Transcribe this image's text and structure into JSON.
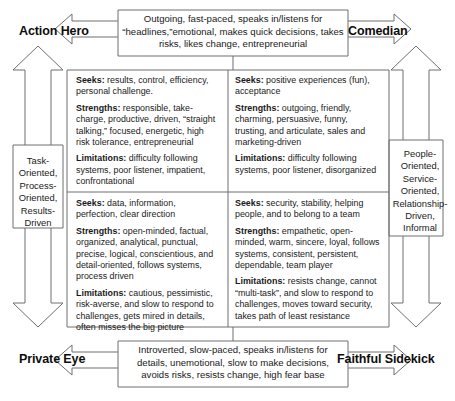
{
  "diagram": {
    "line_color": "#6e6e6e",
    "text_color": "#1a1a1a"
  },
  "corners": {
    "top_left": "Action Hero",
    "top_right": "Comedian",
    "bottom_left": "Private Eye",
    "bottom_right": "Faithful Sidekick"
  },
  "banners": {
    "top": "Outgoing, fast-paced, speaks in/listens for “headlines,”emotional, makes quick decisions, takes risks, likes change, entrepreneurial",
    "bottom": "Introverted, slow-paced, speaks in/listens for details, unemotional, slow to make decisions, avoids risks, resists change, high fear base"
  },
  "sides": {
    "left": "Task-Oriented, Process-Oriented, Results-Driven",
    "right": "People-Oriented, Service-Oriented, Relationship-Driven, Informal"
  },
  "quadrants": {
    "top_left": {
      "seeks_label": "Seeks:",
      "seeks": " results, control, efficiency, personal challenge.",
      "strengths_label": "Strengths:",
      "strengths": " responsible, take-charge, productive, driven, “straight talking,” focused, energetic, high risk tolerance, entrepreneurial",
      "limitations_label": "Limitations:",
      "limitations": " difficulty following systems, poor listener, impatient, confrontational"
    },
    "top_right": {
      "seeks_label": "Seeks:",
      "seeks": " positive experiences (fun), acceptance",
      "strengths_label": "Strengths:",
      "strengths": " outgoing, friendly, charming, persuasive, funny, trusting, and articulate, sales and marketing-driven",
      "limitations_label": "Limitations:",
      "limitations": " difficulty following systems, poor listener, disorganized"
    },
    "bottom_left": {
      "seeks_label": "Seeks:",
      "seeks": " data, information, perfection, clear direction",
      "strengths_label": "Strengths:",
      "strengths": " open-minded, factual, organized, analytical, punctual, precise, logical, conscientious, and detail-oriented, follows systems, process driven",
      "limitations_label": "Limitations:",
      "limitations": " cautious, pessimistic, risk-averse, and slow to respond to challenges, gets mired in details, often misses the big picture"
    },
    "bottom_right": {
      "seeks_label": "Seeks:",
      "seeks": " security, stability, helping people, and  to belong to a team",
      "strengths_label": "Strengths:",
      "strengths": " empathetic, open-minded, warm, sincere, loyal, follows systems, consistent, persistent, dependable, team player",
      "limitations_label": "Limitations:",
      "limitations": " resists change, cannot “multi-task”, and slow to respond to challenges, moves toward security, takes path of least resistance"
    }
  }
}
